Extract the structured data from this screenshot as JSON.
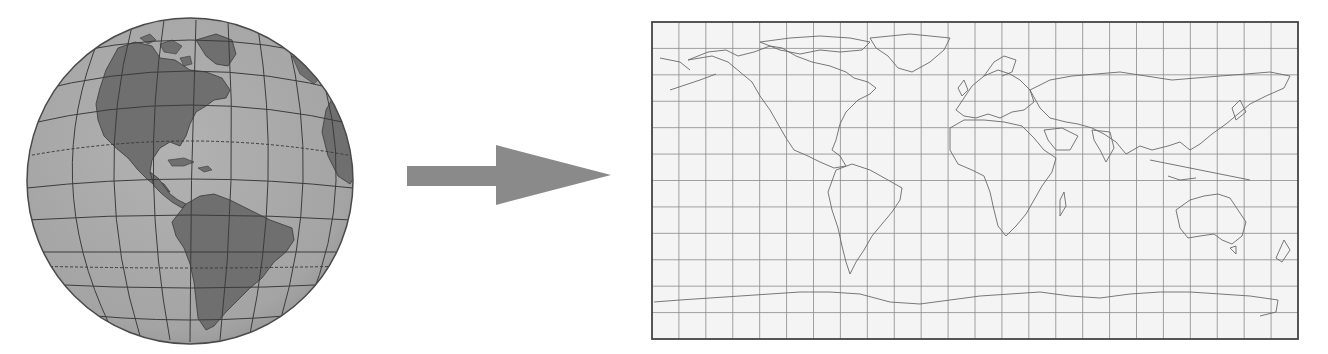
{
  "diagram": {
    "type": "projection-illustration",
    "source": {
      "name": "globe",
      "view": "Western hemisphere (North & South America)",
      "center": [
        190,
        181
      ],
      "radius": 163,
      "colors": {
        "ocean": "#a9a9a9",
        "land": "#6f6f6f",
        "graticule": "#3c3c3c",
        "outline": "#4a4a4a"
      }
    },
    "connector": {
      "name": "arrow",
      "direction": "right",
      "color": "#8a8a8a",
      "shaft": {
        "x1": 407,
        "x2": 496,
        "y1": 166,
        "y2": 186
      },
      "head": {
        "x": 496,
        "tip_x": 611,
        "top": 145,
        "bottom": 205
      }
    },
    "target": {
      "name": "flat-world-map",
      "projection": "rectangular (equirectangular-style)",
      "frame": {
        "left": 652,
        "top": 22,
        "right": 1298,
        "bottom": 339
      },
      "grid": {
        "columns": 24,
        "rows": 12
      },
      "colors": {
        "background": "#f4f4f4",
        "grid": "#7a7a7a",
        "coast": "#6a6a6a",
        "frame": "#444444"
      }
    }
  }
}
